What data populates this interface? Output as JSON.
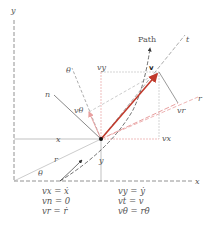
{
  "diagram": {
    "axes": {
      "x_label": "x",
      "y_label": "y"
    },
    "labels": {
      "path": "Path",
      "t_axis": "t",
      "r_axis": "r",
      "n_axis": "n",
      "theta_axis": "θ",
      "velocity": "v",
      "v_theta": "vθ",
      "v_y": "vy",
      "v_r": "vr",
      "v_x": "vx",
      "x_dim": "x",
      "y_dim": "y",
      "r_dim": "r",
      "theta_angle": "θ"
    },
    "colors": {
      "velocity": "#c0392b",
      "component": "#e8a0a0",
      "axis": "#777777"
    }
  },
  "equations": {
    "left": [
      "vx = ẋ",
      "vn = 0",
      "vr = ṙ"
    ],
    "right": [
      "vy = ẏ",
      "vt = v",
      "vθ = rθ̇"
    ]
  }
}
